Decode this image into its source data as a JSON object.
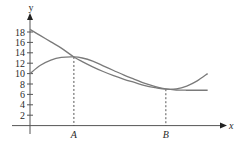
{
  "chart_data": {
    "type": "line",
    "title": "",
    "xlabel": "x",
    "ylabel": "y",
    "ylim": [
      0,
      19
    ],
    "yticks": [
      2,
      4,
      6,
      8,
      10,
      12,
      14,
      16,
      18
    ],
    "ytick_labels": [
      "2",
      "4",
      "6",
      "8",
      "10",
      "12",
      "14",
      "16",
      "18"
    ],
    "x_markers": [
      {
        "label": "A",
        "x": 4.2,
        "y": 13.2
      },
      {
        "label": "B",
        "x": 13.0,
        "y": 7.0
      }
    ],
    "xlim": [
      0,
      19
    ],
    "grid": false,
    "legend": null,
    "series": [
      {
        "name": "curve starting at 18",
        "x": [
          0,
          1,
          2,
          3,
          4.2,
          5,
          6,
          7,
          8,
          9,
          10,
          11,
          12,
          13,
          14,
          15,
          16,
          17
        ],
        "values": [
          18.5,
          17.3,
          16.1,
          14.9,
          13.2,
          12.3,
          11.3,
          10.4,
          9.6,
          8.9,
          8.3,
          7.7,
          7.3,
          7.0,
          7.05,
          7.6,
          8.6,
          10.0
        ]
      },
      {
        "name": "curve starting at 10",
        "x": [
          0,
          1,
          2,
          3,
          4.2,
          5,
          6,
          7,
          8,
          9,
          10,
          11,
          12,
          13,
          14,
          15,
          16,
          17
        ],
        "values": [
          10.0,
          11.6,
          12.6,
          13.1,
          13.2,
          13.0,
          12.4,
          11.5,
          10.6,
          9.7,
          8.9,
          8.1,
          7.5,
          7.05,
          6.85,
          6.8,
          6.8,
          6.8
        ]
      }
    ]
  },
  "colors": {
    "axis": "#555555",
    "curve": "#7a7a7a",
    "text": "#2a2a2a"
  }
}
